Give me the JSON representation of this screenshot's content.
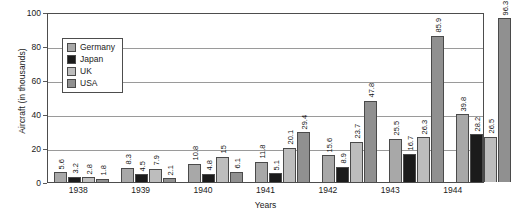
{
  "chart_data": {
    "type": "bar",
    "title": "",
    "subtitle": "",
    "xlabel": "Years",
    "ylabel": "Aircraft (in thousands)",
    "categories": [
      "1938",
      "1939",
      "1940",
      "1941",
      "1942",
      "1943",
      "1944"
    ],
    "series": [
      {
        "name": "Germany",
        "color": "#a8a8a8",
        "values": [
          5.6,
          8.3,
          10.8,
          11.8,
          15.6,
          25.5,
          39.8
        ]
      },
      {
        "name": "Japan",
        "color": "#1b1b1b",
        "values": [
          3.2,
          4.5,
          4.8,
          5.1,
          8.9,
          16.7,
          28.2
        ]
      },
      {
        "name": "UK",
        "color": "#bdbdbd",
        "values": [
          2.8,
          7.9,
          15.0,
          20.1,
          23.7,
          26.3,
          26.5
        ]
      },
      {
        "name": "USA",
        "color": "#909090",
        "values": [
          1.8,
          2.1,
          6.1,
          29.4,
          47.8,
          85.9,
          96.3
        ]
      }
    ],
    "value_labels": [
      [
        "5.6",
        "3.2",
        "2.8",
        "1.8"
      ],
      [
        "8.3",
        "4.5",
        "7.9",
        "2.1"
      ],
      [
        "10.8",
        "4.8",
        "15",
        "6.1"
      ],
      [
        "11.8",
        "5.1",
        "20.1",
        "29.4"
      ],
      [
        "15.6",
        "8.9",
        "23.7",
        "47.8"
      ],
      [
        "25.5",
        "16.7",
        "26.3",
        "85.9"
      ],
      [
        "39.8",
        "28.2",
        "26.5",
        "96.3"
      ]
    ],
    "ylim": [
      0,
      100
    ],
    "yticks": [
      0,
      20,
      40,
      60,
      80,
      100
    ],
    "ytick_labels": [
      "0",
      "20",
      "40",
      "60",
      "80",
      "100"
    ],
    "grid": "horizontal",
    "legend_position": "upper-left-inside"
  }
}
